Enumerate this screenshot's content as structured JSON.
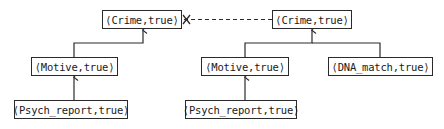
{
  "diagram": {
    "type": "argument-graph",
    "nodes": [
      {
        "id": "crime_left",
        "label": "⟨Crime,true⟩",
        "x": 102,
        "y": 10,
        "w": 80
      },
      {
        "id": "crime_right",
        "label": "⟨Crime,true⟩",
        "x": 272,
        "y": 10,
        "w": 80
      },
      {
        "id": "motive_left",
        "label": "⟨Motive,true⟩",
        "x": 31,
        "y": 57,
        "w": 87
      },
      {
        "id": "motive_mid",
        "label": "⟨Motive,true⟩",
        "x": 201,
        "y": 57,
        "w": 88
      },
      {
        "id": "dna_match",
        "label": "⟨DNA_match,true⟩",
        "x": 328,
        "y": 57,
        "w": 105
      },
      {
        "id": "psych_left",
        "label": "⟨Psych_report,true⟩",
        "x": 14,
        "y": 100,
        "w": 114
      },
      {
        "id": "psych_mid",
        "label": "⟨Psych_report,true⟩",
        "x": 185,
        "y": 100,
        "w": 112
      }
    ],
    "edges": [
      {
        "from": "motive_left",
        "to": "crime_left",
        "style": "solid-arrow"
      },
      {
        "from": "psych_left",
        "to": "motive_left",
        "style": "solid-arrow"
      },
      {
        "from": "motive_mid",
        "to": "crime_right",
        "style": "solid-arrow"
      },
      {
        "from": "dna_match",
        "to": "crime_right",
        "style": "solid-arrow"
      },
      {
        "from": "psych_mid",
        "to": "motive_mid",
        "style": "solid-arrow"
      },
      {
        "from": "crime_right",
        "to": "crime_left",
        "style": "dashed-attack",
        "marker": "cross"
      }
    ],
    "colors": {
      "line": "#2a2a2a",
      "background": "#ffffff"
    }
  }
}
